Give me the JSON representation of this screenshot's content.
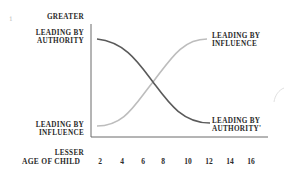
{
  "diagram": {
    "y_axis": {
      "top_label": "GREATER",
      "bottom_label": "LESSER"
    },
    "x_axis": {
      "label": "AGE OF CHILD",
      "ticks": [
        "2",
        "4",
        "6",
        "8",
        "10",
        "12",
        "14",
        "16"
      ]
    },
    "left_labels": {
      "top": [
        "LEADING BY",
        "AUTHORITY"
      ],
      "bottom": [
        "LEADING BY",
        "INFLUENCE"
      ]
    },
    "right_labels": {
      "top": [
        "LEADING BY",
        "INFLUENCE"
      ],
      "bottom": [
        "LEADING BY",
        "AUTHORITY'"
      ]
    },
    "margin_mark": "1",
    "curves": [
      {
        "name": "Leading by Authority",
        "trend": "decreasing",
        "color": "#5a5a5a"
      },
      {
        "name": "Leading by Influence",
        "trend": "increasing",
        "color": "#bdbdbd"
      }
    ],
    "colors": {
      "axis": "#6a6a6a",
      "text": "#2a2a2a"
    }
  }
}
